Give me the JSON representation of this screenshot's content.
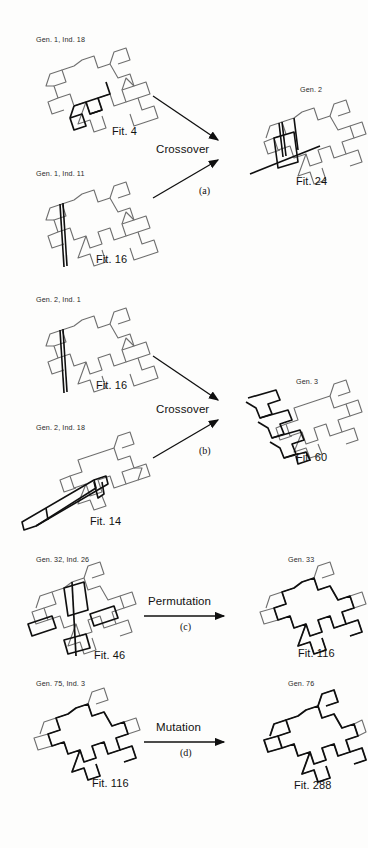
{
  "figure": {
    "type": "scientific-diagram",
    "background_color": "#fdfdfc",
    "line_color_light": "#6f6f6f",
    "line_color_dark": "#101010"
  },
  "operations": [
    {
      "id": "a",
      "operator_label": "Crossover",
      "sub_label": "(a)",
      "arrow_count": 2,
      "parents": [
        {
          "gen_label": "Gen. 1, Ind. 18",
          "fit_label": "Fit. 4",
          "fitness": 4,
          "generation": 1,
          "individual": 18
        },
        {
          "gen_label": "Gen. 1, Ind. 11",
          "fit_label": "Fit. 16",
          "fitness": 16,
          "generation": 1,
          "individual": 11
        }
      ],
      "child": {
        "gen_label": "Gen. 2",
        "fit_label": "Fit. 24",
        "fitness": 24,
        "generation": 2
      }
    },
    {
      "id": "b",
      "operator_label": "Crossover",
      "sub_label": "(b)",
      "arrow_count": 2,
      "parents": [
        {
          "gen_label": "Gen. 2, Ind. 1",
          "fit_label": "Fit. 16",
          "fitness": 16,
          "generation": 2,
          "individual": 1
        },
        {
          "gen_label": "Gen. 2, Ind. 18",
          "fit_label": "Fit. 14",
          "fitness": 14,
          "generation": 2,
          "individual": 18
        }
      ],
      "child": {
        "gen_label": "Gen. 3",
        "fit_label": "Fit. 60",
        "fitness": 60,
        "generation": 3
      }
    },
    {
      "id": "c",
      "operator_label": "Permutation",
      "sub_label": "(c)",
      "arrow_count": 1,
      "parents": [
        {
          "gen_label": "Gen. 32, Ind. 26",
          "fit_label": "Fit. 46",
          "fitness": 46,
          "generation": 32,
          "individual": 26
        }
      ],
      "child": {
        "gen_label": "Gen. 33",
        "fit_label": "Fit. 116",
        "fitness": 116,
        "generation": 33
      }
    },
    {
      "id": "d",
      "operator_label": "Mutation",
      "sub_label": "(d)",
      "arrow_count": 1,
      "parents": [
        {
          "gen_label": "Gen. 75, Ind. 3",
          "fit_label": "Fit. 116",
          "fitness": 116,
          "generation": 75,
          "individual": 3
        }
      ],
      "child": {
        "gen_label": "Gen. 76",
        "fit_label": "Fit. 288",
        "fitness": 288,
        "generation": 76
      }
    }
  ]
}
